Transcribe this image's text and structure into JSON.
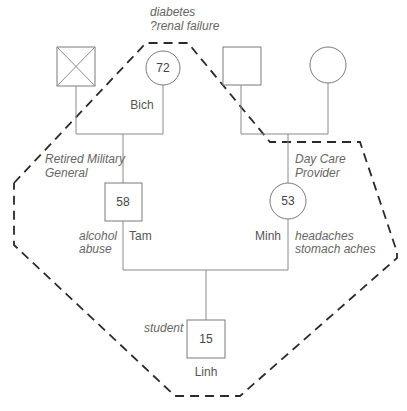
{
  "people": {
    "paternal_grandfather": {
      "symbol": "square-deceased",
      "label": ""
    },
    "paternal_grandmother": {
      "symbol": "circle",
      "name": "Bich",
      "age": "72",
      "notes": [
        "diabetes",
        "?renal failure"
      ]
    },
    "maternal_grandfather": {
      "symbol": "square",
      "label": ""
    },
    "maternal_grandmother": {
      "symbol": "circle",
      "label": ""
    },
    "father": {
      "symbol": "square",
      "name": "Tam",
      "age": "58",
      "occupation": [
        "Retired Military",
        "General"
      ],
      "notes": [
        "alcohol",
        "abuse"
      ]
    },
    "mother": {
      "symbol": "circle",
      "name": "Minh",
      "age": "53",
      "occupation": [
        "Day Care",
        "Provider"
      ],
      "notes": [
        "headaches",
        "stomach aches"
      ]
    },
    "child": {
      "symbol": "square",
      "name": "Linh",
      "age": "15",
      "occupation": [
        "student"
      ]
    }
  },
  "household_boundary": {
    "style": "dashed",
    "color": "#2a2a2a"
  }
}
